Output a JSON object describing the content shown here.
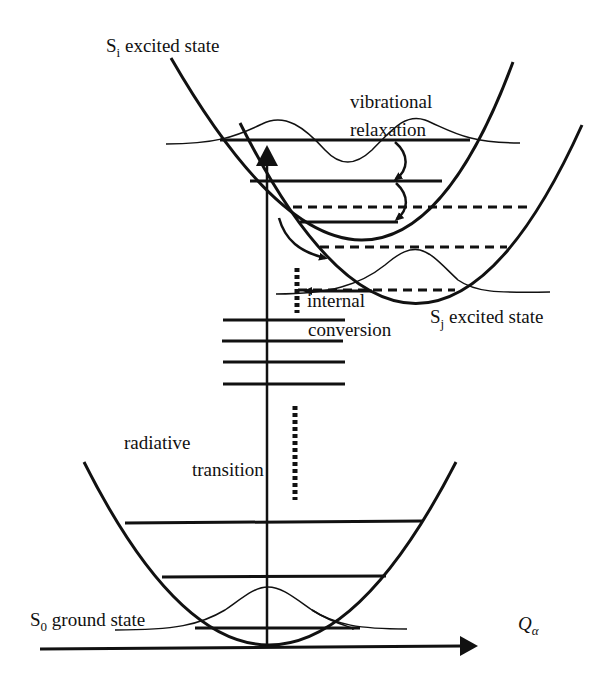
{
  "diagram": {
    "colors": {
      "line": "#111111",
      "background": "#ffffff"
    },
    "labels": {
      "si_prefix": "S",
      "si_sub": "i",
      "si_text": " excited state",
      "sj_prefix": "S",
      "sj_sub": "j",
      "sj_text": " excited state",
      "s0_prefix": "S",
      "s0_sub": "0",
      "s0_text": " ground state",
      "vib_line1": "vibrational",
      "vib_line2": "relaxation",
      "ic_line1": "internal",
      "ic_line2": "conversion",
      "rad_line1": "radiative",
      "rad_line2": "transition",
      "axis_main": "Q",
      "axis_sub": "α"
    },
    "states": [
      {
        "name": "S_i excited state",
        "levels": 3
      },
      {
        "name": "S_j excited state",
        "levels_dashed": 3
      },
      {
        "name": "S_0 ground state",
        "levels": 3
      }
    ],
    "processes": [
      "vibrational relaxation",
      "internal conversion",
      "radiative transition"
    ],
    "axis": "Q_alpha"
  }
}
